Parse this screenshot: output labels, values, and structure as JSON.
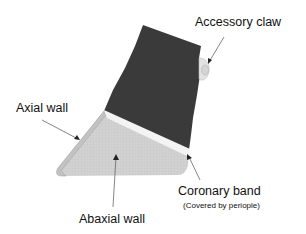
{
  "diagram": {
    "type": "anatomical diagram",
    "labels": {
      "accessory_claw": "Accessory claw",
      "axial_wall": "Axial  wall",
      "coronary_band": "Coronary band",
      "coronary_band_note": "(Covered by periople)",
      "abaxial_wall": "Abaxial wall"
    },
    "colors": {
      "skin": "#3a3a3a",
      "coronary_band": "#f2f2f2",
      "hoof_wall": "#d0d0d0",
      "hoof_wall_edge": "#b8b8b8",
      "accessory_claw": "#e0e0e0",
      "arrow": "#555555",
      "text": "#111111"
    }
  }
}
